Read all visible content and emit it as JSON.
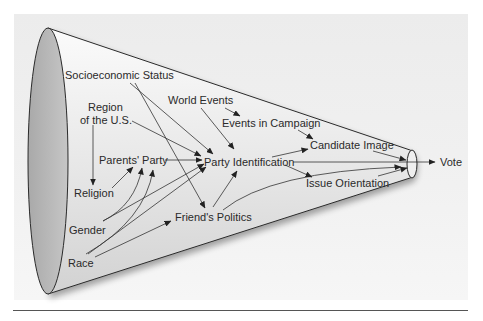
{
  "diagram": {
    "shape": "funnel-cone",
    "colors": {
      "panel_bg": "#eeeeee",
      "cone_fill": "#e4e4e4",
      "cone_mouth": "#bdbdbd",
      "stroke": "#333333",
      "text": "#2a2a2a"
    },
    "nodes": {
      "socioeconomic_status": "Socioeconomic Status",
      "region_line1": "Region",
      "region_line2": "of the U.S.",
      "world_events": "World Events",
      "events_in_campaign": "Events in Campaign",
      "parents_party": "Parents' Party",
      "party_identification": "Party Identification",
      "candidate_image": "Candidate Image",
      "religion": "Religion",
      "issue_orientation": "Issue Orientation",
      "friends_politics": "Friend's Politics",
      "gender": "Gender",
      "race": "Race",
      "vote": "Vote"
    },
    "edges": [
      [
        "Socioeconomic Status",
        "Party Identification"
      ],
      [
        "Socioeconomic Status",
        "Friend's Politics"
      ],
      [
        "Region of the U.S.",
        "Party Identification"
      ],
      [
        "Region of the U.S.",
        "Religion"
      ],
      [
        "World Events",
        "Events in Campaign"
      ],
      [
        "World Events",
        "Party Identification"
      ],
      [
        "Events in Campaign",
        "Candidate Image"
      ],
      [
        "Parents' Party",
        "Party Identification"
      ],
      [
        "Religion",
        "Parents' Party"
      ],
      [
        "Gender",
        "Parents' Party"
      ],
      [
        "Gender",
        "Party Identification"
      ],
      [
        "Race",
        "Parents' Party"
      ],
      [
        "Race",
        "Party Identification"
      ],
      [
        "Race",
        "Friend's Politics"
      ],
      [
        "Friend's Politics",
        "Party Identification"
      ],
      [
        "Friend's Politics",
        "Vote"
      ],
      [
        "Party Identification",
        "Candidate Image"
      ],
      [
        "Party Identification",
        "Issue Orientation"
      ],
      [
        "Party Identification",
        "Vote"
      ],
      [
        "Candidate Image",
        "Vote"
      ],
      [
        "Issue Orientation",
        "Vote"
      ]
    ]
  }
}
